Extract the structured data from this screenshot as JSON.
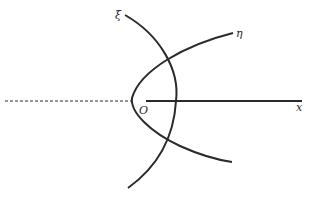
{
  "diagram": {
    "type": "coordinate-curves",
    "labels": {
      "xi": "ξ",
      "eta": "η",
      "origin": "O",
      "x_axis": "x"
    },
    "elements": [
      {
        "name": "x-axis",
        "style": "solid",
        "from": [
          146,
          101
        ],
        "to": [
          302,
          101
        ]
      },
      {
        "name": "negative-x-axis",
        "style": "dashed",
        "from": [
          5,
          101
        ],
        "to": [
          132,
          101
        ]
      },
      {
        "name": "xi-curve",
        "style": "solid",
        "label": "ξ"
      },
      {
        "name": "eta-curve",
        "style": "solid",
        "label": "η"
      }
    ],
    "colors": {
      "stroke": "#2a2a2a",
      "background": "#ffffff"
    }
  }
}
